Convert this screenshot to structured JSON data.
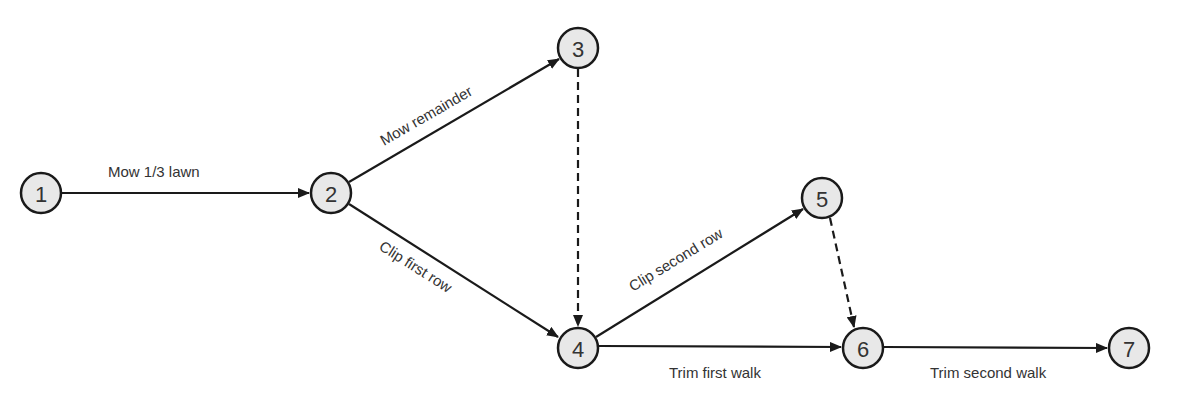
{
  "diagram": {
    "type": "activity-on-arrow network",
    "nodes": [
      {
        "id": "1",
        "label": "1",
        "x": 41,
        "y": 193
      },
      {
        "id": "2",
        "label": "2",
        "x": 331,
        "y": 193
      },
      {
        "id": "3",
        "label": "3",
        "x": 578,
        "y": 48
      },
      {
        "id": "4",
        "label": "4",
        "x": 578,
        "y": 348
      },
      {
        "id": "5",
        "label": "5",
        "x": 822,
        "y": 198
      },
      {
        "id": "6",
        "label": "6",
        "x": 863,
        "y": 348
      },
      {
        "id": "7",
        "label": "7",
        "x": 1129,
        "y": 348
      }
    ],
    "edges": [
      {
        "from": "1",
        "to": "2",
        "label": "Mow 1/3 lawn",
        "dummy": false
      },
      {
        "from": "2",
        "to": "3",
        "label": "Mow remainder",
        "dummy": false
      },
      {
        "from": "2",
        "to": "4",
        "label": "Clip first row",
        "dummy": false
      },
      {
        "from": "3",
        "to": "4",
        "label": "",
        "dummy": true
      },
      {
        "from": "4",
        "to": "5",
        "label": "Clip second row",
        "dummy": false
      },
      {
        "from": "5",
        "to": "6",
        "label": "",
        "dummy": true
      },
      {
        "from": "4",
        "to": "6",
        "label": "Trim first walk",
        "dummy": false
      },
      {
        "from": "6",
        "to": "7",
        "label": "Trim second walk",
        "dummy": false
      }
    ]
  },
  "colors": {
    "node_fill": "#e8e8e8",
    "stroke": "#1a1a1a",
    "text": "#333333"
  }
}
